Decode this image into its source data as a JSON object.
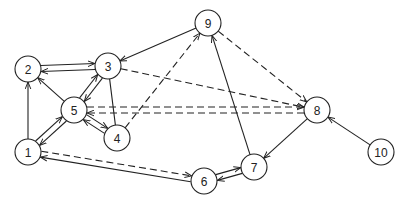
{
  "diagram": {
    "type": "directed-graph",
    "node_radius": 13,
    "colors": {
      "stroke": "#222222",
      "background": "#ffffff",
      "node_fill": "#ffffff"
    },
    "nodes": [
      {
        "id": "1",
        "label": "1",
        "x": 28,
        "y": 152
      },
      {
        "id": "2",
        "label": "2",
        "x": 28,
        "y": 69
      },
      {
        "id": "3",
        "label": "3",
        "x": 108,
        "y": 66
      },
      {
        "id": "4",
        "label": "4",
        "x": 117,
        "y": 138
      },
      {
        "id": "5",
        "label": "5",
        "x": 74,
        "y": 110
      },
      {
        "id": "6",
        "label": "6",
        "x": 204,
        "y": 181
      },
      {
        "id": "7",
        "label": "7",
        "x": 254,
        "y": 167
      },
      {
        "id": "8",
        "label": "8",
        "x": 317,
        "y": 110
      },
      {
        "id": "9",
        "label": "9",
        "x": 208,
        "y": 23
      },
      {
        "id": "10",
        "label": "10",
        "x": 381,
        "y": 152
      }
    ],
    "edges": [
      {
        "from": "1",
        "to": "2",
        "style": "solid",
        "offset": 0
      },
      {
        "from": "2",
        "to": "3",
        "style": "solid",
        "offset": -3
      },
      {
        "from": "3",
        "to": "2",
        "style": "solid",
        "offset": -3
      },
      {
        "from": "5",
        "to": "2",
        "style": "solid",
        "offset": 0
      },
      {
        "from": "1",
        "to": "5",
        "style": "solid",
        "offset": -3
      },
      {
        "from": "5",
        "to": "1",
        "style": "solid",
        "offset": -3
      },
      {
        "from": "5",
        "to": "3",
        "style": "solid",
        "offset": -3
      },
      {
        "from": "3",
        "to": "5",
        "style": "solid",
        "offset": -3
      },
      {
        "from": "3",
        "to": "4",
        "style": "solid",
        "offset": 0,
        "arrow": false
      },
      {
        "from": "5",
        "to": "4",
        "style": "solid",
        "offset": -3
      },
      {
        "from": "4",
        "to": "5",
        "style": "solid",
        "offset": -3
      },
      {
        "from": "9",
        "to": "3",
        "style": "solid",
        "offset": 0
      },
      {
        "from": "4",
        "to": "9",
        "style": "dashed",
        "offset": 0
      },
      {
        "from": "9",
        "to": "8",
        "style": "dashed",
        "offset": 0
      },
      {
        "from": "3",
        "to": "8",
        "style": "dashed",
        "offset": 0
      },
      {
        "from": "8",
        "to": "5",
        "style": "dashed",
        "offset": -3
      },
      {
        "from": "5",
        "to": "8",
        "style": "dashed",
        "offset": -3
      },
      {
        "from": "8",
        "to": "7",
        "style": "solid",
        "offset": 0
      },
      {
        "from": "10",
        "to": "8",
        "style": "solid",
        "offset": 0
      },
      {
        "from": "7",
        "to": "9",
        "style": "solid",
        "offset": 0
      },
      {
        "from": "6",
        "to": "1",
        "style": "solid",
        "offset": -3
      },
      {
        "from": "1",
        "to": "6",
        "style": "dashed",
        "offset": -3
      },
      {
        "from": "6",
        "to": "7",
        "style": "solid",
        "offset": -3
      },
      {
        "from": "7",
        "to": "6",
        "style": "solid",
        "offset": -3
      }
    ]
  }
}
